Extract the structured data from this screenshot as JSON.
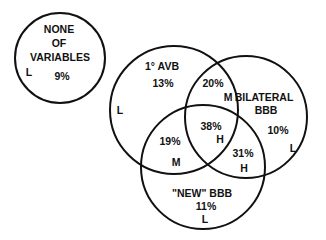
{
  "diagram": {
    "type": "venn",
    "line_color": "#111111",
    "background": "#ffffff",
    "circles": [
      {
        "id": "none",
        "name": "NONE OF VARIABLES",
        "cx": 60,
        "cy": 58,
        "r": 45
      },
      {
        "id": "avb",
        "name": "1° AVB",
        "cx": 174,
        "cy": 110,
        "r": 64
      },
      {
        "id": "bilateral",
        "name": "BILATERAL BBB",
        "cx": 246,
        "cy": 117,
        "r": 61
      },
      {
        "id": "new",
        "name": "\"NEW\" BBB",
        "cx": 203,
        "cy": 167,
        "r": 62
      }
    ],
    "labels": {
      "none_line1": "NONE",
      "none_line2": "OF",
      "none_line3": "VARIABLES",
      "none_pct": "9%",
      "none_risk": "L",
      "avb_name": "1° AVB",
      "avb_pct": "13%",
      "avb_risk": "L",
      "avb_bilateral_pct": "20%",
      "avb_bilateral_risk": "M",
      "bilateral_line1": "BILATERAL",
      "bilateral_line2": "BBB",
      "bilateral_pct": "10%",
      "bilateral_risk": "L",
      "all_three_pct": "38%",
      "all_three_risk": "H",
      "avb_new_pct": "19%",
      "avb_new_risk": "M",
      "bilateral_new_pct": "31%",
      "bilateral_new_risk": "H",
      "new_name": "\"NEW\" BBB",
      "new_pct": "11%",
      "new_risk": "L"
    }
  }
}
